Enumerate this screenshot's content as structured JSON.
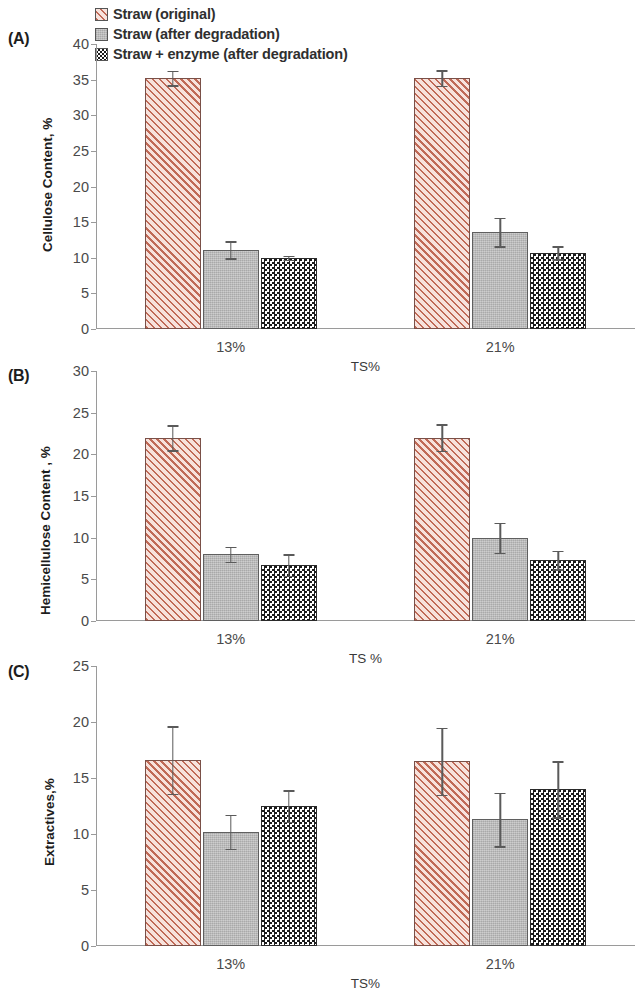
{
  "legend": {
    "items": [
      {
        "label": "Straw (original)",
        "pattern": "diagonal-hatch",
        "color": "#c06a57"
      },
      {
        "label": "Straw (after degradation)",
        "pattern": "solid-gray",
        "color": "#bcbcbc"
      },
      {
        "label": "Straw + enzyme (after degradation)",
        "pattern": "checkerboard",
        "color": "#1b1b1b"
      }
    ]
  },
  "panels": [
    {
      "tag": "(A)",
      "ylabel": "Cellulose Content, %",
      "xlabel": "TS%"
    },
    {
      "tag": "(B)",
      "ylabel": "Hemicellulose Content , %",
      "xlabel": "TS %"
    },
    {
      "tag": "(C)",
      "ylabel": "Extractives,%",
      "xlabel": "TS%"
    }
  ],
  "chart_data": [
    {
      "type": "bar",
      "panel": "(A)",
      "title": "",
      "xlabel": "TS%",
      "ylabel": "Cellulose Content, %",
      "categories": [
        "13%",
        "21%"
      ],
      "ylim": [
        0,
        40
      ],
      "yticks": [
        0,
        5,
        10,
        15,
        20,
        25,
        30,
        35,
        40
      ],
      "grid": false,
      "legend_position": "top-center",
      "series": [
        {
          "name": "Straw (original)",
          "values": [
            35.2,
            35.2
          ],
          "errors": [
            1.0,
            1.1
          ]
        },
        {
          "name": "Straw (after degradation)",
          "values": [
            11.1,
            13.6
          ],
          "errors": [
            1.2,
            2.0
          ]
        },
        {
          "name": "Straw + enzyme (after degradation)",
          "values": [
            10.0,
            10.7
          ],
          "errors": [
            0.3,
            0.9
          ]
        }
      ]
    },
    {
      "type": "bar",
      "panel": "(B)",
      "title": "",
      "xlabel": "TS %",
      "ylabel": "Hemicellulose Content , %",
      "categories": [
        "13%",
        "21%"
      ],
      "ylim": [
        0,
        30
      ],
      "yticks": [
        0,
        5,
        10,
        15,
        20,
        25,
        30
      ],
      "grid": false,
      "legend_position": "top-center",
      "series": [
        {
          "name": "Straw (original)",
          "values": [
            22.0,
            22.0
          ],
          "errors": [
            1.5,
            1.6
          ]
        },
        {
          "name": "Straw (after degradation)",
          "values": [
            8.0,
            10.0
          ],
          "errors": [
            0.9,
            1.8
          ]
        },
        {
          "name": "Straw + enzyme (after degradation)",
          "values": [
            6.7,
            7.3
          ],
          "errors": [
            1.3,
            1.1
          ]
        }
      ]
    },
    {
      "type": "bar",
      "panel": "(C)",
      "title": "",
      "xlabel": "TS%",
      "ylabel": "Extractives,%",
      "categories": [
        "13%",
        "21%"
      ],
      "ylim": [
        0,
        25
      ],
      "yticks": [
        0,
        5,
        10,
        15,
        20,
        25
      ],
      "grid": false,
      "legend_position": "top-center",
      "series": [
        {
          "name": "Straw (original)",
          "values": [
            16.6,
            16.5
          ],
          "errors": [
            3.0,
            3.0
          ]
        },
        {
          "name": "Straw (after degradation)",
          "values": [
            10.2,
            11.3
          ],
          "errors": [
            1.5,
            2.4
          ]
        },
        {
          "name": "Straw + enzyme (after degradation)",
          "values": [
            12.5,
            14.0
          ],
          "errors": [
            1.4,
            2.5
          ]
        }
      ]
    }
  ]
}
